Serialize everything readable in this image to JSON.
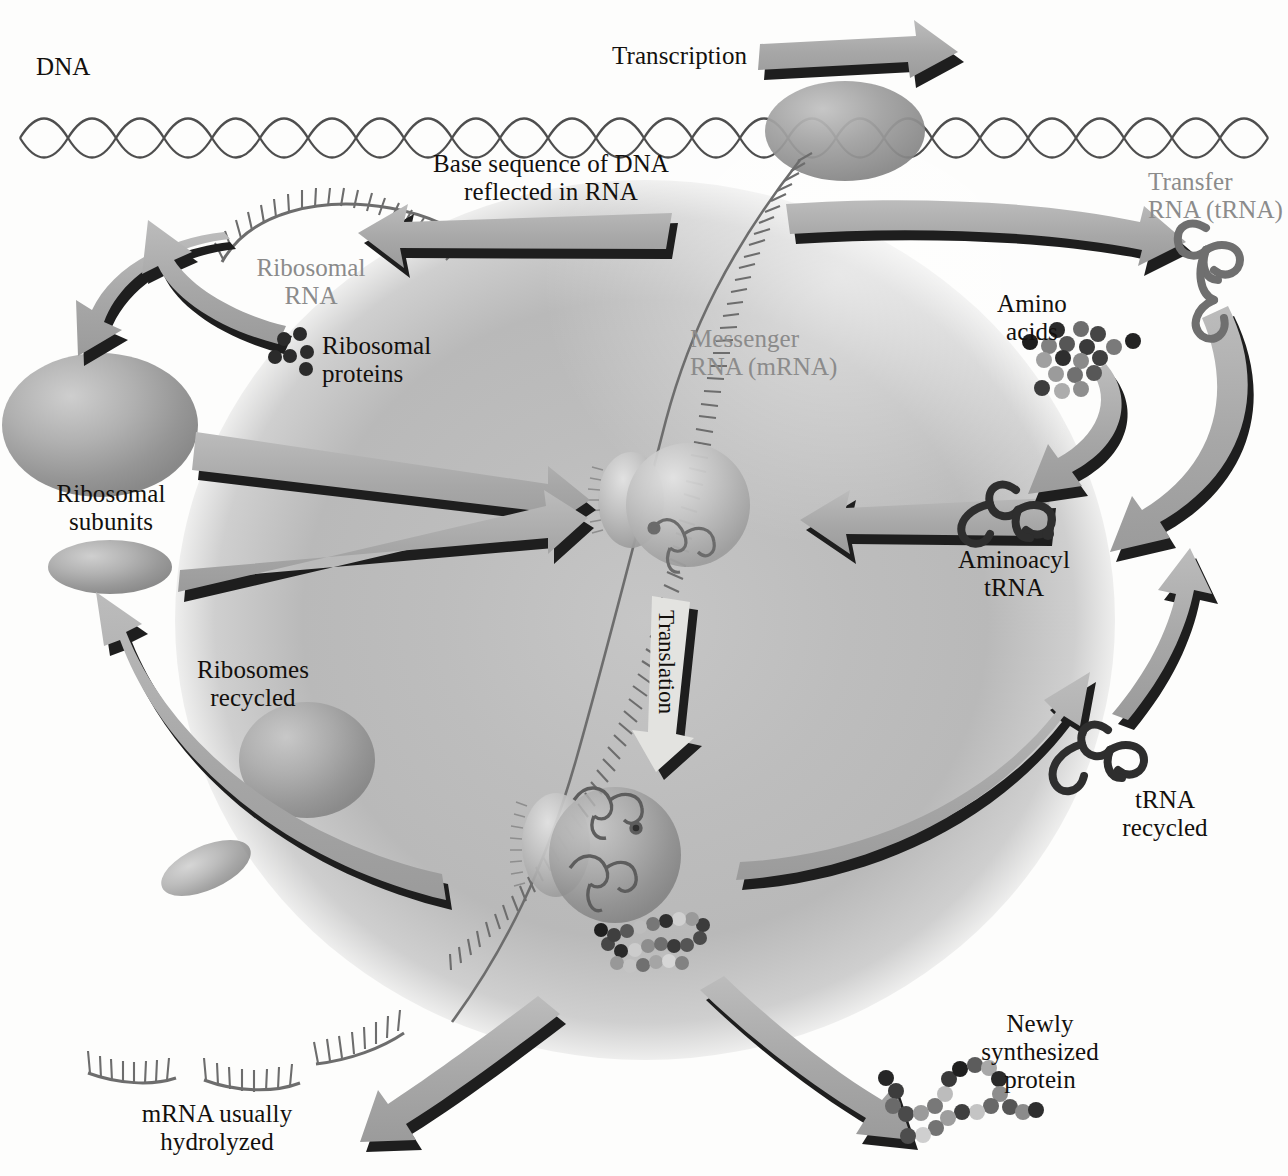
{
  "diagram": {
    "palette": {
      "background": "#fdfdfc",
      "cell_blob": "#b4b4b4",
      "arrow_fill": "#a9a9a9",
      "arrow_shadow": "#1a1a1a",
      "label_text": "#13100d",
      "rna_label_text": "#8b8b8b",
      "dna_stroke": "#4e4e4e",
      "mrna_stroke": "#6d6d6d",
      "trna_dark": "#2e2e2e",
      "trna_mid": "#6f6f6f",
      "ribosome_large": "#9a9a9a",
      "ribosome_small": "#8f8f8f"
    },
    "labels": {
      "dna": "DNA",
      "transcription": "Transcription",
      "base_sequence": "Base sequence of DNA\nreflected in RNA",
      "ribosomal_rna": "Ribosomal\nRNA",
      "ribosomal_proteins": "Ribosomal\nproteins",
      "ribosomal_subunits": "Ribosomal\nsubunits",
      "ribosomes_recycled": "Ribosomes\nrecycled",
      "messenger_rna": "Messenger\nRNA (mRNA)",
      "transfer_rna": "Transfer\nRNA (tRNA)",
      "amino_acids": "Amino\nacids",
      "aminoacyl_trna": "Aminoacyl\ntRNA",
      "trna_recycled": "tRNA\nrecycled",
      "translation": "Translation",
      "mrna_hydrolyzed": "mRNA usually\nhydrolyzed",
      "newly_synthesized_protein": "Newly\nsynthesized\nprotein"
    },
    "icon_names": {
      "dna": "dna-double-helix-icon",
      "rna_polymerase": "rna-polymerase-ellipse-icon",
      "mrna_strand": "mrna-strand-icon",
      "rrna_arc": "ribosomal-rna-arc-icon",
      "ribosomal_protein_dots": "ribosomal-protein-dots-icon",
      "large_subunit": "large-ribosomal-subunit-icon",
      "small_subunit": "small-ribosomal-subunit-icon",
      "trna": "trna-cloverleaf-icon",
      "aminoacyl_trna": "aminoacyl-trna-icon",
      "amino_acid_dots": "amino-acid-dots-icon",
      "initiating_ribosome": "initiating-ribosome-icon",
      "elongating_ribosome": "elongating-ribosome-icon",
      "polypeptide": "polypeptide-chain-icon",
      "mrna_fragments": "mrna-fragments-icon"
    },
    "arrows": [
      {
        "name": "transcription-arrow",
        "label": "Transcription",
        "direction": "right"
      },
      {
        "name": "base-sequence-to-rrna-arrow",
        "label": "Base sequence of DNA reflected in RNA",
        "direction": "left"
      },
      {
        "name": "rrna-to-subunits-arrow",
        "label": "",
        "direction": "left"
      },
      {
        "name": "ribosomal-proteins-to-subunits-arrow",
        "label": "",
        "direction": "left"
      },
      {
        "name": "transcription-to-trna-arrow",
        "label": "",
        "direction": "right"
      },
      {
        "name": "large-subunit-to-ribosome-arrow",
        "label": "",
        "direction": "right"
      },
      {
        "name": "small-subunit-to-ribosome-arrow",
        "label": "",
        "direction": "right"
      },
      {
        "name": "aminoacyl-trna-to-ribosome-arrow",
        "label": "",
        "direction": "left"
      },
      {
        "name": "amino-acids-to-aminoacyl-arrow",
        "label": "",
        "direction": "down-left"
      },
      {
        "name": "trna-charging-arrow",
        "label": "",
        "direction": "down-left"
      },
      {
        "name": "translation-arrow",
        "label": "Translation",
        "direction": "down"
      },
      {
        "name": "trna-recycled-arrow",
        "label": "tRNA recycled",
        "direction": "up-right"
      },
      {
        "name": "ribosomes-recycled-arrow",
        "label": "Ribosomes recycled",
        "direction": "up"
      },
      {
        "name": "mrna-hydrolysis-arrow",
        "label": "mRNA usually hydrolyzed",
        "direction": "down-left"
      },
      {
        "name": "protein-release-arrow",
        "label": "Newly synthesized protein",
        "direction": "down-right"
      }
    ]
  }
}
